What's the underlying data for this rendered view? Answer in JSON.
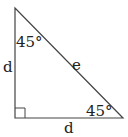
{
  "diagram": {
    "type": "right-triangle",
    "colors": {
      "stroke": "#444444",
      "text": "#222222",
      "background": "#ffffff"
    },
    "vertices": {
      "top": [
        15,
        8
      ],
      "bottom_left": [
        15,
        118
      ],
      "bottom_right": [
        123,
        118
      ]
    },
    "labels": {
      "top_angle": "45°",
      "bottom_right_angle": "45°",
      "left_side": "d",
      "bottom_side": "d",
      "hypotenuse": "e"
    },
    "right_angle_marker": {
      "vertex": "bottom_left",
      "size": 10
    }
  }
}
